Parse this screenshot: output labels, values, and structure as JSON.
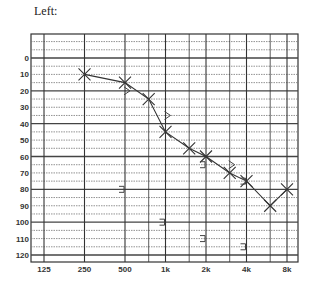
{
  "chart_data": {
    "type": "line",
    "title": "Left:",
    "xlabel": "",
    "ylabel": "",
    "x_scale": "log2",
    "x_tick_labels": [
      "125",
      "250",
      "500",
      "1k",
      "2k",
      "4k",
      "8k"
    ],
    "x_ticks_hz": [
      125,
      250,
      500,
      1000,
      2000,
      4000,
      8000
    ],
    "x_minor_hz": [
      750,
      1500,
      3000,
      6000
    ],
    "y_tick_labels": [
      "0",
      "10",
      "20",
      "30",
      "40",
      "50",
      "60",
      "70",
      "80",
      "90",
      "100",
      "110",
      "120"
    ],
    "ylim": [
      -20,
      125
    ],
    "y_inverted": true,
    "grid": true,
    "series": [
      {
        "name": "Air conduction (X)",
        "marker": "x",
        "connected": true,
        "points": [
          {
            "hz": 250,
            "db": 10
          },
          {
            "hz": 500,
            "db": 15
          },
          {
            "hz": 750,
            "db": 25
          },
          {
            "hz": 1000,
            "db": 45
          },
          {
            "hz": 1500,
            "db": 55
          },
          {
            "hz": 2000,
            "db": 60
          },
          {
            "hz": 3000,
            "db": 70
          },
          {
            "hz": 4000,
            "db": 75
          },
          {
            "hz": 6000,
            "db": 90
          },
          {
            "hz": 8000,
            "db": 80
          }
        ]
      },
      {
        "name": "Bone conduction unmasked (>)",
        "marker": ">",
        "connected": false,
        "points": [
          {
            "hz": 500,
            "db": 20
          },
          {
            "hz": 1000,
            "db": 35
          },
          {
            "hz": 3000,
            "db": 65
          }
        ]
      },
      {
        "name": "Bone conduction masked (])",
        "marker": "]",
        "connected": false,
        "points": [
          {
            "hz": 2000,
            "db": 65
          },
          {
            "hz": 4000,
            "db": 75
          },
          {
            "hz": 500,
            "db": 80
          },
          {
            "hz": 1000,
            "db": 100
          },
          {
            "hz": 2000,
            "db": 110
          },
          {
            "hz": 4000,
            "db": 115
          }
        ]
      }
    ]
  }
}
